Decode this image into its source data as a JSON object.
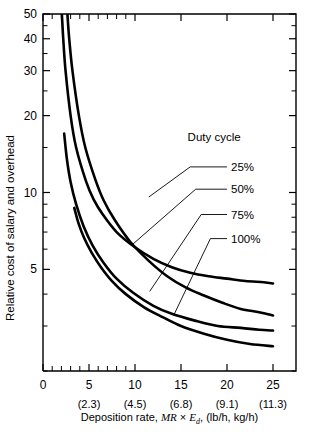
{
  "chart_data": {
    "type": "line",
    "title": "",
    "xlabel": "Deposition rate, MR × Ed, (lb/h, kg/h)",
    "xlabel_parts": {
      "lead": "Deposition rate, ",
      "math1": "MR",
      "times": " × ",
      "math2": "E",
      "math2_sub": "d",
      "tail": ", (lb/h, kg/h)"
    },
    "ylabel": "Relative cost of salary and overhead",
    "yscale": "log",
    "xscale": "linear",
    "xlim": [
      0,
      27.5
    ],
    "ylim": [
      2,
      50
    ],
    "grid": false,
    "x_ticks": [
      0,
      5,
      10,
      15,
      20,
      25
    ],
    "x_tick_labels": [
      "0",
      "5",
      "10",
      "15",
      "20",
      "25"
    ],
    "x_secondary_ticks": [
      5,
      10,
      15,
      20,
      25
    ],
    "x_secondary_labels": [
      "(2.3)",
      "(4.5)",
      "(6.8)",
      "(9.1)",
      "(11.3)"
    ],
    "x_secondary_unit": "kg/h",
    "x_minor_ticks": [
      1,
      2,
      3,
      4,
      6,
      7,
      8,
      9
    ],
    "y_ticks": [
      5,
      10,
      20,
      30,
      40,
      50
    ],
    "y_tick_labels": [
      "5",
      "10",
      "20",
      "30",
      "40",
      "50"
    ],
    "y_minor_ticks": [
      2,
      3,
      4,
      6,
      7,
      8,
      9,
      15,
      25,
      35,
      45
    ],
    "legend_title": "Duty cycle",
    "legend_position": "inside-right",
    "series": [
      {
        "name": "25%",
        "label": "25%",
        "points": [
          [
            2.05,
            50
          ],
          [
            2.2,
            40
          ],
          [
            2.45,
            30
          ],
          [
            3.0,
            20
          ],
          [
            3.6,
            15
          ],
          [
            4.7,
            11
          ],
          [
            5.5,
            9.4
          ],
          [
            6.5,
            8.2
          ],
          [
            8.0,
            7.0
          ],
          [
            10.0,
            6.1
          ],
          [
            12.0,
            5.5
          ],
          [
            14.0,
            5.1
          ],
          [
            16.0,
            4.85
          ],
          [
            18.0,
            4.7
          ],
          [
            20.0,
            4.6
          ],
          [
            22.0,
            4.5
          ],
          [
            24.0,
            4.45
          ],
          [
            25.0,
            4.4
          ]
        ]
      },
      {
        "name": "50%",
        "label": "50%",
        "points": [
          [
            2.65,
            50
          ],
          [
            2.85,
            40
          ],
          [
            3.2,
            30
          ],
          [
            3.9,
            20
          ],
          [
            4.6,
            15
          ],
          [
            5.7,
            11.2
          ],
          [
            6.6,
            9.3
          ],
          [
            7.8,
            7.8
          ],
          [
            9.5,
            6.4
          ],
          [
            11.5,
            5.4
          ],
          [
            13.5,
            4.7
          ],
          [
            15.5,
            4.25
          ],
          [
            17.5,
            3.95
          ],
          [
            19.5,
            3.7
          ],
          [
            21.5,
            3.5
          ],
          [
            23.5,
            3.4
          ],
          [
            25.0,
            3.3
          ]
        ]
      },
      {
        "name": "75%",
        "label": "75%",
        "points": [
          [
            2.3,
            17.0
          ],
          [
            2.6,
            13.5
          ],
          [
            3.0,
            11.0
          ],
          [
            3.6,
            9.0
          ],
          [
            4.4,
            7.4
          ],
          [
            5.4,
            6.2
          ],
          [
            6.6,
            5.3
          ],
          [
            8.0,
            4.6
          ],
          [
            9.8,
            4.05
          ],
          [
            12.0,
            3.6
          ],
          [
            14.0,
            3.35
          ],
          [
            16.5,
            3.15
          ],
          [
            19.0,
            3.0
          ],
          [
            21.5,
            2.95
          ],
          [
            23.5,
            2.9
          ],
          [
            25.0,
            2.88
          ]
        ]
      },
      {
        "name": "100%",
        "label": "100%",
        "points": [
          [
            3.4,
            8.7
          ],
          [
            3.9,
            7.5
          ],
          [
            4.5,
            6.6
          ],
          [
            5.3,
            5.8
          ],
          [
            6.3,
            5.1
          ],
          [
            7.5,
            4.5
          ],
          [
            9.0,
            4.0
          ],
          [
            11.0,
            3.55
          ],
          [
            13.0,
            3.25
          ],
          [
            15.0,
            3.0
          ],
          [
            17.5,
            2.8
          ],
          [
            20.0,
            2.65
          ],
          [
            22.5,
            2.55
          ],
          [
            25.0,
            2.5
          ]
        ]
      }
    ],
    "annotations": [
      {
        "label": "25%",
        "leader_from": [
          11.5,
          9.6
        ],
        "leader_elbow": [
          16.0,
          12.6
        ],
        "leader_to": [
          20.0,
          12.6
        ]
      },
      {
        "label": "50%",
        "leader_from": [
          9.6,
          6.2
        ],
        "leader_elbow": [
          16.6,
          10.3
        ],
        "leader_to": [
          20.0,
          10.3
        ]
      },
      {
        "label": "75%",
        "leader_from": [
          11.6,
          4.1
        ],
        "leader_elbow": [
          17.2,
          8.2
        ],
        "leader_to": [
          20.0,
          8.2
        ]
      },
      {
        "label": "100%",
        "leader_from": [
          14.2,
          3.3
        ],
        "leader_elbow": [
          18.2,
          6.6
        ],
        "leader_to": [
          20.0,
          6.6
        ]
      }
    ]
  },
  "legend": {
    "title": "Duty cycle",
    "items": [
      {
        "label": "25%"
      },
      {
        "label": "50%"
      },
      {
        "label": "75%"
      },
      {
        "label": "100%"
      }
    ]
  },
  "axes": {
    "y_title": "Relative cost of salary and overhead",
    "x_title_lead": "Deposition rate, ",
    "x_title_math1": "MR",
    "x_title_times": "×",
    "x_title_math2": "E",
    "x_title_math2_sub": "d",
    "x_title_tail": ", (lb/h, kg/h)"
  },
  "colors": {
    "ink": "#000000",
    "background": "#ffffff"
  }
}
